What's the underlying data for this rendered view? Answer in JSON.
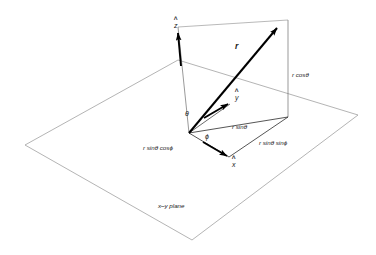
{
  "figure": {
    "background_color": "#ffffff",
    "plane_stroke": "#8c8c8c",
    "thin_stroke": "#3a3a3a",
    "vector_stroke": "#000000",
    "text_color": "#1a1a1a",
    "caption": "x–y plane"
  },
  "vectors": {
    "r_label": "r",
    "z_hat": "z",
    "y_hat": "y",
    "x_hat": "x"
  },
  "angles": {
    "theta": "θ",
    "phi": "ϕ"
  },
  "components": {
    "r_cos_theta": "r cosθ",
    "r_sin_theta": "r sinθ",
    "r_sin_theta_cos_phi": "r  sinθ cosϕ",
    "r_sin_theta_sin_phi": "r  sinθ sinϕ"
  },
  "geometry": {
    "origin": [
      189,
      133
    ],
    "plane_corners": [
      [
        178,
        60
      ],
      [
        358,
        115
      ],
      [
        192,
        240
      ],
      [
        25,
        145
      ]
    ],
    "r_tip": [
      283,
      22
    ],
    "z_tip": [
      178,
      27
    ],
    "projection_point": [
      288,
      117
    ],
    "r_top_corner": [
      288,
      20
    ]
  }
}
